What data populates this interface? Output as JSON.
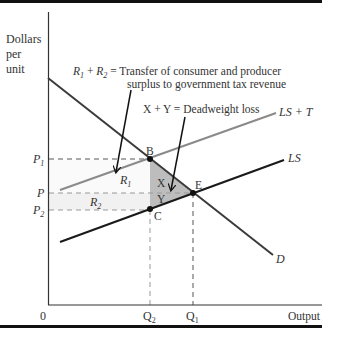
{
  "diagram": {
    "y_axis_label": [
      "Dollars",
      "per",
      "unit"
    ],
    "x_axis_label": "Output",
    "origin_label": "0",
    "price_labels": {
      "p1": {
        "base": "P",
        "sub": "1"
      },
      "p": {
        "base": "P",
        "sub": ""
      },
      "p2": {
        "base": "P",
        "sub": "2"
      }
    },
    "quantity_labels": {
      "q2": {
        "base": "Q",
        "sub": "2"
      },
      "q1": {
        "base": "Q",
        "sub": "1"
      }
    },
    "curves": {
      "ls_plus_t": "LS + T",
      "ls": "LS",
      "demand": "D"
    },
    "points": {
      "b": "B",
      "c": "C",
      "e": "E"
    },
    "regions": {
      "r1": {
        "base": "R",
        "sub": "1"
      },
      "r2": {
        "base": "R",
        "sub": "2"
      },
      "x": "X",
      "y": "Y"
    },
    "annotations": {
      "transfer_line1_prefix_r1": {
        "base": "R",
        "sub": "1"
      },
      "transfer_plus": "+",
      "transfer_line1_prefix_r2": {
        "base": "R",
        "sub": "2"
      },
      "transfer_line1": "= Transfer of consumer and producer",
      "transfer_line2": "surplus to government tax revenue",
      "deadweight": "X + Y = Deadweight loss"
    },
    "colors": {
      "axis": "#333333",
      "demand": "#3a3a3a",
      "ls": "#1a1a1a",
      "ls_plus_t": "#8a8a8a",
      "deadweight_fill": "#bdbdbd",
      "dashed": "#555555",
      "border": "#111111"
    }
  }
}
